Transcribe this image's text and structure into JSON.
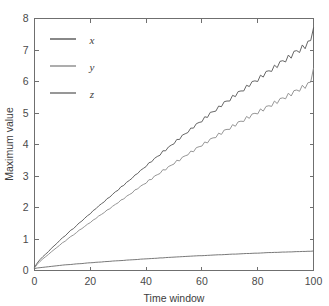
{
  "chart_data": {
    "type": "line",
    "title": "",
    "xlabel": "Time window",
    "ylabel": "Maximum value",
    "xlim": [
      0,
      100
    ],
    "ylim": [
      0,
      8
    ],
    "xticks": [
      0,
      20,
      40,
      60,
      80,
      100
    ],
    "yticks": [
      0,
      1,
      2,
      3,
      4,
      5,
      6,
      7,
      8
    ],
    "grid": false,
    "legend_position": "upper-left-inside",
    "legend": [
      "x",
      "y",
      "z"
    ],
    "series": [
      {
        "name": "x",
        "color": "#555555",
        "x": [
          0,
          1,
          2,
          3,
          4,
          5,
          6,
          7,
          8,
          9,
          10,
          11,
          12,
          13,
          14,
          15,
          16,
          17,
          18,
          19,
          20,
          21,
          22,
          23,
          24,
          25,
          26,
          27,
          28,
          29,
          30,
          31,
          32,
          33,
          34,
          35,
          36,
          37,
          38,
          39,
          40,
          41,
          42,
          43,
          44,
          45,
          46,
          47,
          48,
          49,
          50,
          51,
          52,
          53,
          54,
          55,
          56,
          57,
          58,
          59,
          60,
          61,
          62,
          63,
          64,
          65,
          66,
          67,
          68,
          69,
          70,
          71,
          72,
          73,
          74,
          75,
          76,
          77,
          78,
          79,
          80,
          81,
          82,
          83,
          84,
          85,
          86,
          87,
          88,
          89,
          90,
          91,
          92,
          93,
          94,
          95,
          96,
          97,
          98,
          99,
          100
        ],
        "values": [
          0.1,
          0.24,
          0.35,
          0.44,
          0.52,
          0.6,
          0.7,
          0.78,
          0.86,
          0.95,
          1.04,
          1.1,
          1.19,
          1.28,
          1.33,
          1.42,
          1.51,
          1.57,
          1.66,
          1.74,
          1.8,
          1.9,
          1.96,
          2.05,
          2.12,
          2.18,
          2.28,
          2.33,
          2.42,
          2.5,
          2.55,
          2.66,
          2.7,
          2.8,
          2.86,
          2.93,
          3.03,
          3.08,
          3.18,
          3.24,
          3.3,
          3.42,
          3.45,
          3.56,
          3.62,
          3.66,
          3.8,
          3.8,
          3.92,
          3.98,
          4.02,
          4.16,
          4.16,
          4.3,
          4.34,
          4.38,
          4.52,
          4.52,
          4.66,
          4.7,
          4.72,
          4.88,
          4.86,
          5.02,
          5.04,
          5.06,
          5.22,
          5.2,
          5.36,
          5.38,
          5.38,
          5.56,
          5.52,
          5.68,
          5.7,
          5.7,
          5.88,
          5.84,
          6.0,
          6.02,
          6.0,
          6.2,
          6.14,
          6.32,
          6.34,
          6.32,
          6.52,
          6.44,
          6.64,
          6.66,
          6.62,
          6.84,
          6.74,
          6.96,
          6.98,
          6.92,
          7.16,
          7.04,
          7.28,
          7.3,
          7.7
        ]
      },
      {
        "name": "y",
        "color": "#8a8a8a",
        "x": [
          0,
          1,
          2,
          3,
          4,
          5,
          6,
          7,
          8,
          9,
          10,
          11,
          12,
          13,
          14,
          15,
          16,
          17,
          18,
          19,
          20,
          21,
          22,
          23,
          24,
          25,
          26,
          27,
          28,
          29,
          30,
          31,
          32,
          33,
          34,
          35,
          36,
          37,
          38,
          39,
          40,
          41,
          42,
          43,
          44,
          45,
          46,
          47,
          48,
          49,
          50,
          51,
          52,
          53,
          54,
          55,
          56,
          57,
          58,
          59,
          60,
          61,
          62,
          63,
          64,
          65,
          66,
          67,
          68,
          69,
          70,
          71,
          72,
          73,
          74,
          75,
          76,
          77,
          78,
          79,
          80,
          81,
          82,
          83,
          84,
          85,
          86,
          87,
          88,
          89,
          90,
          91,
          92,
          93,
          94,
          95,
          96,
          97,
          98,
          99,
          100
        ],
        "values": [
          0.08,
          0.2,
          0.29,
          0.37,
          0.44,
          0.51,
          0.59,
          0.66,
          0.73,
          0.8,
          0.88,
          0.93,
          1.01,
          1.08,
          1.13,
          1.2,
          1.28,
          1.33,
          1.4,
          1.47,
          1.52,
          1.6,
          1.65,
          1.73,
          1.78,
          1.84,
          1.92,
          1.96,
          2.04,
          2.1,
          2.15,
          2.24,
          2.27,
          2.36,
          2.41,
          2.46,
          2.56,
          2.59,
          2.68,
          2.73,
          2.77,
          2.88,
          2.89,
          3.0,
          3.04,
          3.08,
          3.2,
          3.19,
          3.3,
          3.34,
          3.38,
          3.5,
          3.48,
          3.6,
          3.64,
          3.67,
          3.79,
          3.77,
          3.9,
          3.93,
          3.95,
          4.08,
          4.05,
          4.18,
          4.21,
          4.22,
          4.36,
          4.32,
          4.46,
          4.48,
          4.48,
          4.63,
          4.58,
          4.72,
          4.74,
          4.73,
          4.89,
          4.83,
          4.97,
          4.99,
          4.97,
          5.13,
          5.06,
          5.21,
          5.23,
          5.21,
          5.38,
          5.3,
          5.46,
          5.48,
          5.45,
          5.63,
          5.54,
          5.71,
          5.73,
          5.69,
          5.88,
          5.78,
          5.96,
          5.98,
          6.42
        ]
      },
      {
        "name": "z",
        "color": "#6a6a6a",
        "x": [
          0,
          1,
          2,
          3,
          4,
          5,
          6,
          7,
          8,
          9,
          10,
          11,
          12,
          13,
          14,
          15,
          16,
          17,
          18,
          19,
          20,
          21,
          22,
          23,
          24,
          25,
          26,
          27,
          28,
          29,
          30,
          31,
          32,
          33,
          34,
          35,
          36,
          37,
          38,
          39,
          40,
          41,
          42,
          43,
          44,
          45,
          46,
          47,
          48,
          49,
          50,
          51,
          52,
          53,
          54,
          55,
          56,
          57,
          58,
          59,
          60,
          61,
          62,
          63,
          64,
          65,
          66,
          67,
          68,
          69,
          70,
          71,
          72,
          73,
          74,
          75,
          76,
          77,
          78,
          79,
          80,
          81,
          82,
          83,
          84,
          85,
          86,
          87,
          88,
          89,
          90,
          91,
          92,
          93,
          94,
          95,
          96,
          97,
          98,
          99,
          100
        ],
        "values": [
          0.06,
          0.08,
          0.09,
          0.1,
          0.11,
          0.12,
          0.13,
          0.14,
          0.15,
          0.16,
          0.17,
          0.18,
          0.185,
          0.19,
          0.2,
          0.21,
          0.215,
          0.22,
          0.23,
          0.24,
          0.245,
          0.25,
          0.26,
          0.265,
          0.27,
          0.28,
          0.285,
          0.29,
          0.3,
          0.305,
          0.31,
          0.315,
          0.32,
          0.33,
          0.335,
          0.34,
          0.345,
          0.35,
          0.36,
          0.365,
          0.37,
          0.375,
          0.38,
          0.385,
          0.39,
          0.4,
          0.4,
          0.41,
          0.415,
          0.42,
          0.425,
          0.43,
          0.435,
          0.44,
          0.445,
          0.45,
          0.455,
          0.46,
          0.465,
          0.47,
          0.47,
          0.475,
          0.48,
          0.485,
          0.49,
          0.495,
          0.5,
          0.5,
          0.505,
          0.51,
          0.515,
          0.52,
          0.52,
          0.525,
          0.53,
          0.535,
          0.54,
          0.54,
          0.545,
          0.55,
          0.55,
          0.555,
          0.56,
          0.565,
          0.57,
          0.57,
          0.575,
          0.575,
          0.58,
          0.585,
          0.585,
          0.59,
          0.59,
          0.595,
          0.6,
          0.6,
          0.605,
          0.605,
          0.61,
          0.61,
          0.62
        ]
      }
    ]
  },
  "axes": {
    "x_tick_labels": [
      "0",
      "20",
      "40",
      "60",
      "80",
      "100"
    ],
    "y_tick_labels": [
      "0",
      "1",
      "2",
      "3",
      "4",
      "5",
      "6",
      "7",
      "8"
    ],
    "xlabel": "Time window",
    "ylabel": "Maximum value"
  },
  "legend_items": [
    {
      "label": "x",
      "color": "#555555"
    },
    {
      "label": "y",
      "color": "#8a8a8a"
    },
    {
      "label": "z",
      "color": "#6a6a6a"
    }
  ],
  "colors": {
    "background": "#ffffff",
    "axis": "#6f6f6f",
    "text": "#3d3d3d"
  }
}
